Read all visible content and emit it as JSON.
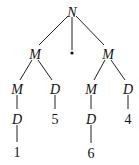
{
  "diagram": {
    "type": "tree",
    "nodes": [
      {
        "id": "n0",
        "label": "N",
        "italic": true,
        "x": 72,
        "y": 12
      },
      {
        "id": "n1",
        "label": "M",
        "italic": true,
        "x": 35,
        "y": 54
      },
      {
        "id": "dot",
        "label": "•",
        "italic": false,
        "x": 72,
        "y": 52
      },
      {
        "id": "n2",
        "label": "M",
        "italic": true,
        "x": 108,
        "y": 54
      },
      {
        "id": "n3",
        "label": "M",
        "italic": true,
        "x": 17,
        "y": 89
      },
      {
        "id": "n4",
        "label": "D",
        "italic": true,
        "x": 55,
        "y": 89
      },
      {
        "id": "n5",
        "label": "M",
        "italic": true,
        "x": 91,
        "y": 89
      },
      {
        "id": "n6",
        "label": "D",
        "italic": true,
        "x": 128,
        "y": 89
      },
      {
        "id": "n7",
        "label": "D",
        "italic": true,
        "x": 17,
        "y": 119
      },
      {
        "id": "n8",
        "label": "5",
        "italic": false,
        "x": 55,
        "y": 119
      },
      {
        "id": "n9",
        "label": "D",
        "italic": true,
        "x": 91,
        "y": 119
      },
      {
        "id": "n10",
        "label": "4",
        "italic": false,
        "x": 128,
        "y": 119
      },
      {
        "id": "n11",
        "label": "1",
        "italic": false,
        "x": 17,
        "y": 152
      },
      {
        "id": "n12",
        "label": "6",
        "italic": false,
        "x": 91,
        "y": 153
      }
    ],
    "edges": [
      [
        "n0",
        "n1"
      ],
      [
        "n0",
        "dot"
      ],
      [
        "n0",
        "n2"
      ],
      [
        "n1",
        "n3"
      ],
      [
        "n1",
        "n4"
      ],
      [
        "n2",
        "n5"
      ],
      [
        "n2",
        "n6"
      ],
      [
        "n3",
        "n7"
      ],
      [
        "n4",
        "n8"
      ],
      [
        "n5",
        "n9"
      ],
      [
        "n6",
        "n10"
      ],
      [
        "n7",
        "n11"
      ],
      [
        "n9",
        "n12"
      ]
    ]
  }
}
